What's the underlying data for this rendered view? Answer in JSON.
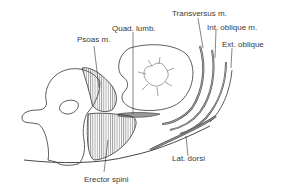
{
  "diagram": {
    "type": "anatomical cross-section",
    "labels": {
      "psoas": "Psoas m.",
      "quad_lumb": "Quad. lumb.",
      "transversus": "Transversus m.",
      "int_oblique": "Int. oblique m.",
      "ext_oblique": "Ext. oblique",
      "lat_dorsi": "Lat. dorsi",
      "erector_spini": "Erector spini"
    },
    "colors": {
      "line": "#333333",
      "hatch": "#555555",
      "muscle_fill": "#9a9a9a",
      "label_text": "#3a3a3a",
      "background": "#ffffff"
    }
  }
}
